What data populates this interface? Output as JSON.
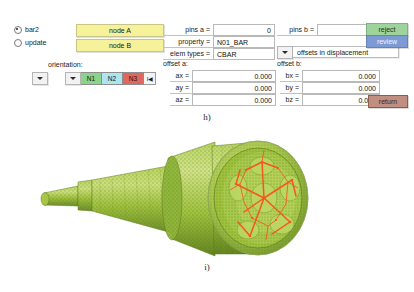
{
  "panel": {
    "radio_options": [
      {
        "label": "bar2",
        "selected": true
      },
      {
        "label": "update",
        "selected": false
      }
    ],
    "node_buttons": [
      {
        "label": "node A"
      },
      {
        "label": "node B"
      }
    ],
    "orientation": {
      "title": "orientation:",
      "left_dropdown_icon": "chevron-down-icon",
      "node_dropdown_icon": "chevron-down-icon",
      "nodes": [
        {
          "label": "N1",
          "color": "#8bd38b"
        },
        {
          "label": "N2",
          "color": "#ade4ef"
        },
        {
          "label": "N3",
          "color": "#e0675e"
        }
      ],
      "end_button_icon": "skip-to-start-icon",
      "end_button_glyph": "I◀"
    },
    "fields": {
      "pins_a": {
        "label": "pins  a =",
        "value": "0"
      },
      "pins_b": {
        "label": "pins b =",
        "value": "4"
      },
      "property": {
        "label": "property =",
        "value": "N01_BAR"
      },
      "elem_types": {
        "label": "elem types =",
        "value": "CBAR"
      },
      "offsets_combo": {
        "icon": "chevron-down-icon",
        "value": "offsets in displacement"
      }
    },
    "offset_a": {
      "title": "offset a:",
      "rows": [
        {
          "label": "ax =",
          "value": "0.000"
        },
        {
          "label": "ay =",
          "value": "0.000"
        },
        {
          "label": "az =",
          "value": "0.000"
        }
      ]
    },
    "offset_b": {
      "title": "offset b:",
      "rows": [
        {
          "label": "bx =",
          "value": "0.000"
        },
        {
          "label": "by =",
          "value": "0.000"
        },
        {
          "label": "bz =",
          "value": "0.000"
        }
      ]
    },
    "actions": {
      "reject": {
        "label": "reject",
        "color": "#9ed49b"
      },
      "review": {
        "label": "review",
        "color": "#7e9ad4"
      },
      "return": {
        "label": "return",
        "color": "#c08f82"
      }
    }
  },
  "captions": {
    "panel_caption": "h)",
    "figure_caption": "i)"
  },
  "figure": {
    "name": "fem-mesh-shaft-joint",
    "mesh_color": "#9cc13f",
    "mesh_highlight": "#c6dd72",
    "mesh_shade": "#7ea033",
    "bar_element_color": "#f4581d",
    "node_dot_color": "#2f6a22"
  }
}
